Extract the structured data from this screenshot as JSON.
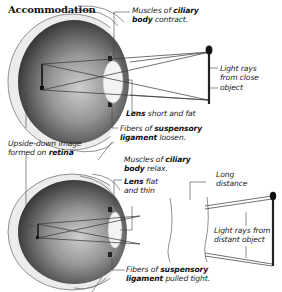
{
  "title": "Accommodation",
  "top_eye": {
    "labels": {
      "ciliary": {
        "pre": "Muscles of ",
        "bold": "ciliary",
        "bold2": "body",
        "post": " contract."
      },
      "light_rays": [
        "Light rays",
        "from close",
        "object"
      ],
      "lens": {
        "bold": "Lens",
        "post": " short and fat"
      },
      "fibers": {
        "pre": "Fibers of ",
        "bold": "suspensory",
        "bold2": "ligament",
        "post": " loosen."
      }
    }
  },
  "retina_label": {
    "line1": "Upside-down image",
    "pre": "formed on ",
    "bold": "retina"
  },
  "bottom_eye": {
    "labels": {
      "ciliary": {
        "pre": "Muscles of ",
        "bold": "ciliary",
        "bold2": "body",
        "post": " relax."
      },
      "lens": {
        "bold": "Lens",
        "post1": " flat",
        "line2": "and thin"
      },
      "long_distance": [
        "Long",
        "distance"
      ],
      "light_rays": [
        "Light rays from",
        "distant object"
      ],
      "fibers": {
        "pre": "Fibers of ",
        "bold": "suspensory",
        "bold2": "ligament",
        "post": " pulled tight."
      }
    }
  },
  "colors": {
    "eyeball_dark": "#3a3a3a",
    "eyeball_light": "#cfcfcf",
    "sclera": "#e8e8e8",
    "lens": "#f2f2f2",
    "line": "#333333"
  }
}
